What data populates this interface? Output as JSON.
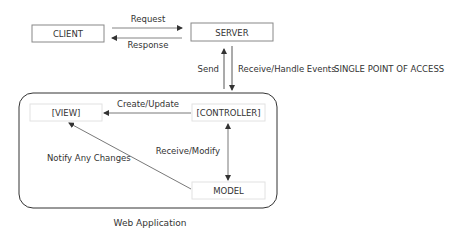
{
  "nodes": {
    "client": "CLIENT",
    "server": "SERVER",
    "view": "[VIEW]",
    "controller": "[CONTROLLER]",
    "model": "MODEL"
  },
  "edges": {
    "request": "Request",
    "response": "Response",
    "send": "Send",
    "receive_handle": "Receive/Handle Events",
    "create_update": "Create/Update",
    "receive_modify": "Receive/Modify",
    "notify": "Notify Any Changes"
  },
  "annotations": {
    "single_point": "SINGLE POINT OF ACCESS",
    "container_label": "Web Application"
  },
  "colors": {
    "line": "#444444",
    "box_border": "#888888",
    "inner_box_border": "#dddddd"
  }
}
